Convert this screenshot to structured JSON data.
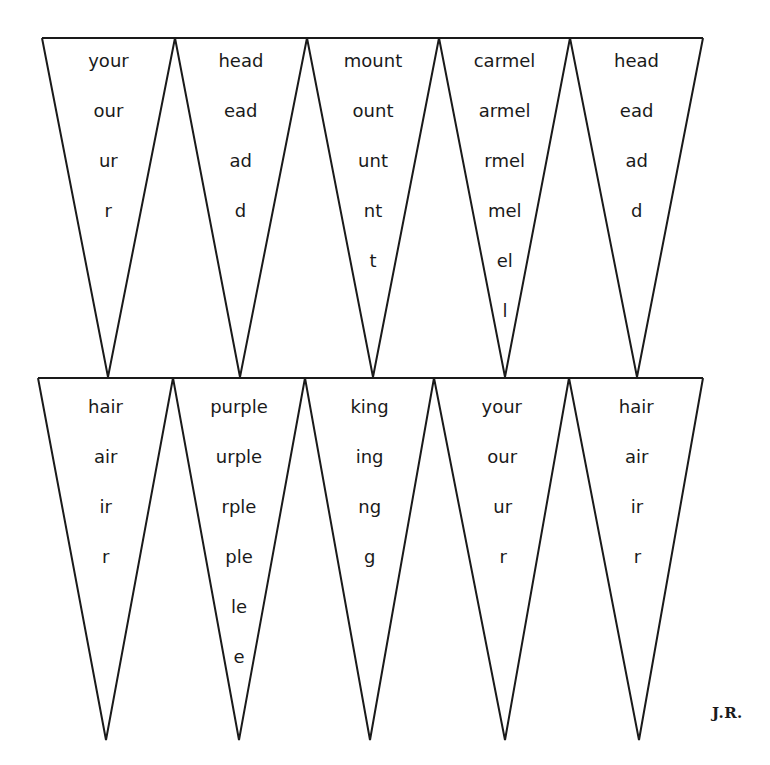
{
  "colors": {
    "line": "#1a1a1a",
    "text": "#1a1a1a",
    "background": "#ffffff"
  },
  "rows": [
    {
      "top_y": 38,
      "tip_y": 377,
      "vertices_x": [
        42,
        175,
        307,
        439,
        570,
        703
      ],
      "tips_x": [
        108,
        240,
        373,
        505,
        637
      ],
      "first_line_y": 61,
      "line_pitch": 50,
      "pennants": [
        {
          "words": [
            "your",
            "our",
            "ur",
            "r"
          ]
        },
        {
          "words": [
            "head",
            "ead",
            "ad",
            "d"
          ]
        },
        {
          "words": [
            "mount",
            "ount",
            "unt",
            "nt",
            "t"
          ]
        },
        {
          "words": [
            "carmel",
            "armel",
            "rmel",
            "mel",
            "el",
            "l"
          ]
        },
        {
          "words": [
            "head",
            "ead",
            "ad",
            "d"
          ]
        }
      ]
    },
    {
      "top_y": 378,
      "tip_y": 740,
      "vertices_x": [
        38,
        173,
        305,
        434,
        569,
        703
      ],
      "tips_x": [
        106,
        239,
        370,
        505,
        639
      ],
      "first_line_y": 407,
      "line_pitch": 50,
      "pennants": [
        {
          "words": [
            "hair",
            "air",
            "ir",
            "r"
          ]
        },
        {
          "words": [
            "purple",
            "urple",
            "rple",
            "ple",
            "le",
            "e"
          ]
        },
        {
          "words": [
            "king",
            "ing",
            "ng",
            "g"
          ]
        },
        {
          "words": [
            "your",
            "our",
            "ur",
            "r"
          ]
        },
        {
          "words": [
            "hair",
            "air",
            "ir",
            "r"
          ]
        }
      ]
    }
  ],
  "signature": "J.R."
}
